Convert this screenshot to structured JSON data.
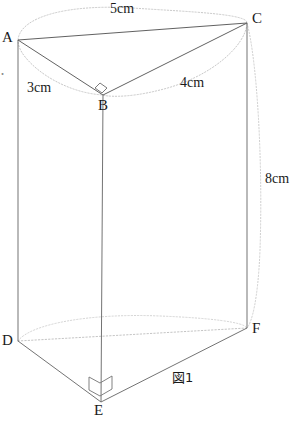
{
  "figure": {
    "caption": "図1",
    "background_color": "#ffffff",
    "solid_line_color": "#555555",
    "hidden_line_color": "#b9b9b9",
    "label_color": "#1a1a1a"
  },
  "vertices": [
    {
      "id": "A",
      "label": "A",
      "x": 18,
      "y": 40,
      "label_x": 2,
      "label_y": 33
    },
    {
      "id": "B",
      "label": "B",
      "x": 103,
      "y": 95,
      "label_x": 98,
      "label_y": 98
    },
    {
      "id": "C",
      "label": "C",
      "x": 247,
      "y": 23,
      "label_x": 253,
      "label_y": 14
    },
    {
      "id": "D",
      "label": "D",
      "x": 18,
      "y": 341,
      "label_x": 2,
      "label_y": 334
    },
    {
      "id": "E",
      "label": "E",
      "x": 101,
      "y": 402,
      "label_x": 95,
      "label_y": 403
    },
    {
      "id": "F",
      "label": "F",
      "x": 247,
      "y": 328,
      "label_x": 253,
      "label_y": 322
    }
  ],
  "measurements": [
    {
      "id": "AC",
      "label": "5cm",
      "edge": "A-C",
      "value": 5,
      "unit": "cm",
      "x": 110,
      "y": 3
    },
    {
      "id": "AB",
      "label": "3cm",
      "edge": "A-B",
      "value": 3,
      "unit": "cm",
      "x": 27,
      "y": 82
    },
    {
      "id": "BC",
      "label": "4cm",
      "edge": "B-C",
      "value": 4,
      "unit": "cm",
      "x": 180,
      "y": 77
    },
    {
      "id": "CF",
      "label": "8cm",
      "edge": "C-F",
      "value": 8,
      "unit": "cm",
      "x": 266,
      "y": 172
    }
  ],
  "edge_fragment": {
    "label": "・"
  },
  "right_angles": [
    {
      "at": "B",
      "note": "right angle at B in triangle ABC"
    },
    {
      "at": "E",
      "note": "right angle at E in triangle DEF"
    }
  ],
  "edges": {
    "solid": [
      "A-C",
      "A-B",
      "B-C",
      "A-D",
      "B-E",
      "C-F",
      "D-E",
      "E-F"
    ],
    "hidden": [
      "D-F"
    ]
  },
  "guides": {
    "top_ellipse": "dotted circumcircle through A, B, C",
    "bottom_ellipse_partial": "dotted arc near D-F",
    "right_side_curve": "dotted cylinder silhouette right of C-F"
  }
}
